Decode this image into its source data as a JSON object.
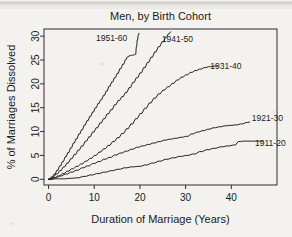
{
  "chart_data": {
    "type": "line",
    "title": "Men, by Birth Cohort",
    "xlabel": "Duration of Marriage (Years)",
    "ylabel": "% of Marriages Dissolved",
    "xlim": [
      -1,
      50
    ],
    "ylim": [
      -1.2,
      31.5
    ],
    "xticks": [
      0,
      10,
      20,
      30,
      40
    ],
    "yticks": [
      0,
      5,
      10,
      15,
      20,
      25,
      30
    ],
    "grid": false,
    "legend": "inline-labels",
    "line_color": "#1a1a1a",
    "background_color": "#f4f2ee",
    "series": [
      {
        "name": "1951-60",
        "label_x": 13.8,
        "label_y": 29.6,
        "x": [
          0,
          0.6,
          1.2,
          1.8,
          2.4,
          3.0,
          3.6,
          4.2,
          4.8,
          5.4,
          6.0,
          6.6,
          7.2,
          7.8,
          8.4,
          9.0,
          9.6,
          10.2,
          10.8,
          11.4,
          12.0,
          12.6,
          13.2,
          13.8,
          14.4,
          15.0,
          15.6,
          16.2,
          16.8,
          17.2,
          17.6,
          18.2,
          18.7,
          19.0,
          19.2,
          19.4,
          19.6,
          19.8
        ],
        "y": [
          0,
          0.5,
          1.1,
          1.9,
          2.8,
          3.7,
          4.7,
          5.6,
          6.6,
          7.6,
          8.5,
          9.5,
          10.4,
          11.4,
          12.3,
          13.2,
          14.1,
          15.0,
          15.9,
          16.7,
          17.6,
          18.5,
          19.5,
          20.4,
          21.3,
          22.2,
          23.2,
          24.1,
          25.1,
          25.6,
          25.9,
          26.0,
          26.1,
          26.2,
          27.8,
          29.2,
          30.2,
          30.6
        ]
      },
      {
        "name": "1941-50",
        "label_x": 28.2,
        "label_y": 29.4,
        "x": [
          0,
          0.8,
          1.6,
          2.4,
          3.2,
          4.0,
          4.8,
          5.6,
          6.4,
          7.2,
          8.0,
          8.8,
          9.6,
          10.4,
          11.2,
          12.0,
          12.8,
          13.6,
          14.4,
          15.2,
          16.0,
          16.8,
          17.6,
          18.4,
          19.2,
          20.0,
          20.8,
          21.6,
          22.4,
          23.2,
          24.0,
          24.8,
          25.6,
          26.2,
          26.7
        ],
        "y": [
          0,
          0.5,
          1.1,
          1.8,
          2.6,
          3.4,
          4.3,
          5.2,
          6.1,
          7.0,
          8.0,
          8.9,
          9.9,
          10.8,
          11.8,
          12.7,
          13.7,
          14.6,
          15.6,
          16.5,
          17.3,
          18.2,
          19.2,
          20.3,
          21.3,
          22.3,
          23.4,
          24.5,
          25.6,
          26.7,
          27.8,
          28.8,
          29.8,
          30.5,
          30.9
        ]
      },
      {
        "name": "1931-40",
        "label_x": 38.8,
        "label_y": 23.8,
        "x": [
          0,
          1.0,
          2.0,
          3.0,
          4.0,
          5.0,
          6.0,
          7.0,
          8.0,
          9.0,
          10.0,
          11.0,
          12.0,
          13.0,
          14.0,
          15.0,
          16.0,
          17.0,
          18.0,
          19.0,
          20.0,
          21.0,
          22.0,
          23.0,
          24.0,
          25.0,
          26.0,
          27.0,
          28.0,
          29.0,
          30.0,
          31.0,
          32.0,
          33.0,
          34.0,
          35.0,
          36.0,
          37.0
        ],
        "y": [
          0,
          0.3,
          0.7,
          1.2,
          1.7,
          2.2,
          2.7,
          3.2,
          3.8,
          4.4,
          5.0,
          5.7,
          6.4,
          7.1,
          7.9,
          8.7,
          9.6,
          10.6,
          11.6,
          12.7,
          13.8,
          14.9,
          16.0,
          17.0,
          17.9,
          18.7,
          19.4,
          20.1,
          20.8,
          21.4,
          21.9,
          22.4,
          22.8,
          23.1,
          23.4,
          23.6,
          23.7,
          23.8
        ]
      },
      {
        "name": "1921-30",
        "label_x": 44.5,
        "label_y": 12.9,
        "x": [
          0,
          1.2,
          2.4,
          3.6,
          4.8,
          6.0,
          7.2,
          8.4,
          9.6,
          10.8,
          12.0,
          13.2,
          14.4,
          15.6,
          16.8,
          18.0,
          19.2,
          20.4,
          21.6,
          22.8,
          24.0,
          25.2,
          26.4,
          27.6,
          28.8,
          30.0,
          31.2,
          32.4,
          33.6,
          34.8,
          36.0,
          37.2,
          38.4,
          39.6,
          40.8,
          42.0,
          43.2,
          44.0
        ],
        "y": [
          0,
          0.3,
          0.7,
          1.1,
          1.5,
          1.9,
          2.4,
          2.8,
          3.3,
          3.7,
          4.2,
          4.6,
          5.1,
          5.5,
          5.9,
          6.3,
          6.7,
          7.0,
          7.3,
          7.6,
          7.9,
          8.2,
          8.4,
          8.6,
          8.8,
          9.0,
          9.5,
          9.9,
          10.2,
          10.5,
          10.8,
          11.0,
          11.2,
          11.3,
          11.4,
          11.6,
          11.9,
          12.0
        ]
      },
      {
        "name": "1911-20",
        "label_x": 45.2,
        "label_y": 7.7,
        "x": [
          0,
          1.5,
          3.0,
          4.5,
          6.0,
          7.5,
          9.0,
          10.5,
          12.0,
          13.5,
          15.0,
          16.5,
          18.0,
          19.5,
          21.0,
          22.5,
          24.0,
          25.5,
          27.0,
          28.5,
          30.0,
          31.5,
          33.0,
          34.5,
          36.0,
          37.5,
          39.0,
          40.5,
          41.5,
          42.5,
          44.0,
          45.5,
          47.0
        ],
        "y": [
          0,
          0.1,
          0.1,
          0.2,
          0.3,
          0.6,
          0.9,
          1.2,
          1.5,
          1.8,
          2.1,
          2.4,
          2.6,
          2.7,
          3.0,
          3.4,
          3.8,
          4.2,
          4.5,
          4.8,
          5.0,
          5.3,
          5.8,
          6.2,
          6.5,
          6.8,
          7.0,
          7.2,
          7.9,
          8.0,
          8.0,
          8.0,
          8.0
        ]
      }
    ]
  },
  "figure": {
    "title": "Men, by Birth Cohort",
    "xlabel": "Duration of Marriage (Years)",
    "ylabel": "% of Marriages Dissolved",
    "xticks": [
      "0",
      "10",
      "20",
      "30",
      "40"
    ],
    "yticks": [
      "0",
      "5",
      "10",
      "15",
      "20",
      "25",
      "30"
    ],
    "series_labels": [
      "1951-60",
      "1941-50",
      "1931-40",
      "1921-30",
      "1911-20"
    ]
  }
}
